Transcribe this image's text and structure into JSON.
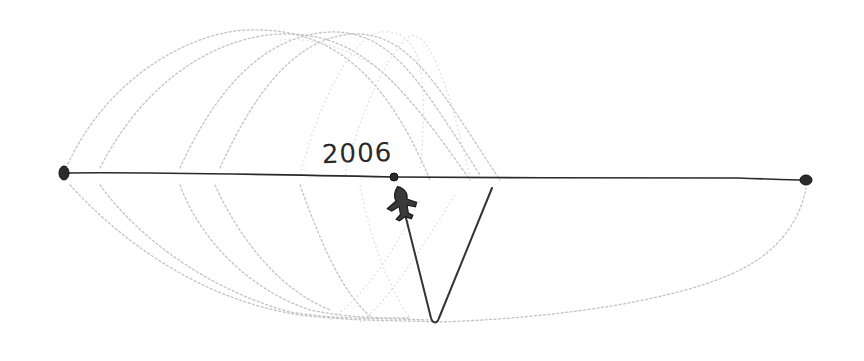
{
  "sketch": {
    "title": "Timeline sketch",
    "year_label": "2006",
    "colors": {
      "ink": "#2a2a2a",
      "pencil_arcs": "#b9b9b9",
      "background": "#ffffff"
    },
    "timeline": {
      "start_point": {
        "x": 64,
        "y": 173
      },
      "midpoint": {
        "x": 394,
        "y": 177,
        "label": "2006"
      },
      "end_point": {
        "x": 806,
        "y": 180
      }
    },
    "marker_icon": "airplane-icon",
    "v_path": {
      "from": {
        "x": 404,
        "y": 215
      },
      "bottom": {
        "x": 435,
        "y": 323
      },
      "to": {
        "x": 492,
        "y": 188
      }
    }
  }
}
